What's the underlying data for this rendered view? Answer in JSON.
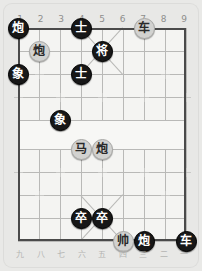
{
  "board": {
    "columns": 9,
    "rows": 10,
    "top_labels": [
      "1",
      "2",
      "3",
      "4",
      "5",
      "6",
      "7",
      "8",
      "9"
    ],
    "bottom_labels": [
      "九",
      "八",
      "七",
      "六",
      "五",
      "四",
      "三",
      "二",
      "一"
    ],
    "colors": {
      "plate": "#e8e8e6",
      "surface": "#f4f4f2",
      "grid_line": "#b9b9b7",
      "border": "#4a4a4a",
      "black_piece": "#171717",
      "gray_piece": "#d2d2d0",
      "top_label_text": "#8e8e8c",
      "bottom_label_text": "#b4b4b2"
    },
    "pieces": [
      {
        "name": "cannon-black-c1r0",
        "char": "炮",
        "side": "black",
        "col": 0,
        "row": 0
      },
      {
        "name": "advisor-black-c4r0",
        "char": "士",
        "side": "black",
        "col": 3,
        "row": 0
      },
      {
        "name": "chariot-gray-c7r0",
        "char": "车",
        "side": "gray",
        "col": 6,
        "row": 0
      },
      {
        "name": "cannon-gray-c2r1",
        "char": "炮",
        "side": "gray",
        "col": 1,
        "row": 1
      },
      {
        "name": "general-black-c5r1",
        "char": "将",
        "side": "black",
        "col": 4,
        "row": 1
      },
      {
        "name": "elephant-black-c1r2",
        "char": "象",
        "side": "black",
        "col": 0,
        "row": 2
      },
      {
        "name": "advisor-black-c4r2",
        "char": "士",
        "side": "black",
        "col": 3,
        "row": 2
      },
      {
        "name": "elephant-black-c3r4",
        "char": "象",
        "side": "black",
        "col": 2,
        "row": 4
      },
      {
        "name": "horse-gray-c4r5",
        "char": "马",
        "side": "gray",
        "col": 3,
        "row": 5
      },
      {
        "name": "cannon-gray-c5r5",
        "char": "炮",
        "side": "gray",
        "col": 4,
        "row": 5
      },
      {
        "name": "pawn-black-c4r8",
        "char": "卒",
        "side": "black",
        "col": 3,
        "row": 8
      },
      {
        "name": "pawn-black-c5r8",
        "char": "卒",
        "side": "black",
        "col": 4,
        "row": 8
      },
      {
        "name": "marshal-gray-c6r9",
        "char": "帅",
        "side": "gray",
        "col": 5,
        "row": 9
      },
      {
        "name": "cannon-black-c7r9",
        "char": "炮",
        "side": "black",
        "col": 6,
        "row": 9
      },
      {
        "name": "chariot-black-c9r9",
        "char": "车",
        "side": "black",
        "col": 8,
        "row": 9
      }
    ]
  }
}
